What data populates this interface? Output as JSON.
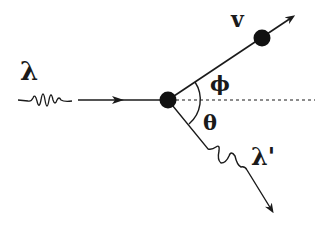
{
  "diagram": {
    "type": "compton-scattering",
    "labels": {
      "incident_wavelength": "λ",
      "scattered_wavelength": "λ'",
      "electron_velocity": "v",
      "electron_angle": "ϕ",
      "photon_angle": "θ"
    },
    "nodes": [
      {
        "id": "collision-point",
        "x": 168,
        "y": 100
      },
      {
        "id": "recoil-electron",
        "x": 262,
        "y": 38
      }
    ],
    "edges": [
      {
        "from": "incident-photon",
        "to": "collision-point",
        "style": "solid-arrow"
      },
      {
        "from": "collision-point",
        "to": "recoil-electron",
        "style": "solid-arrow"
      },
      {
        "from": "collision-point",
        "to": "scattered-photon",
        "style": "wavy-arrow"
      },
      {
        "from": "collision-point",
        "to": "reference-axis",
        "style": "dashed"
      }
    ],
    "colors": {
      "ink": "#1a1a1a",
      "background": "#ffffff"
    }
  }
}
